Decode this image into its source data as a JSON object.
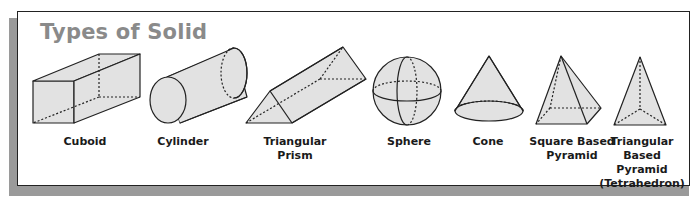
{
  "title": "Types of Solid",
  "colors": {
    "fill": "#e2e2e2",
    "stroke": "#222222",
    "title": "#8a8a8a",
    "shadow": "#9a9a9a"
  },
  "solids": [
    {
      "name": "cuboid",
      "label": "Cuboid"
    },
    {
      "name": "cylinder",
      "label": "Cylinder"
    },
    {
      "name": "triangular-prism",
      "label": "Triangular Prism"
    },
    {
      "name": "sphere",
      "label": "Sphere"
    },
    {
      "name": "cone",
      "label": "Cone"
    },
    {
      "name": "square-based-pyramid",
      "label_line1": "Square Based",
      "label_line2": "Pyramid"
    },
    {
      "name": "triangular-based-pyramid",
      "label_line1": "Triangular",
      "label_line2": "Based Pyramid",
      "label_line3": "(Tetrahedron)"
    }
  ]
}
